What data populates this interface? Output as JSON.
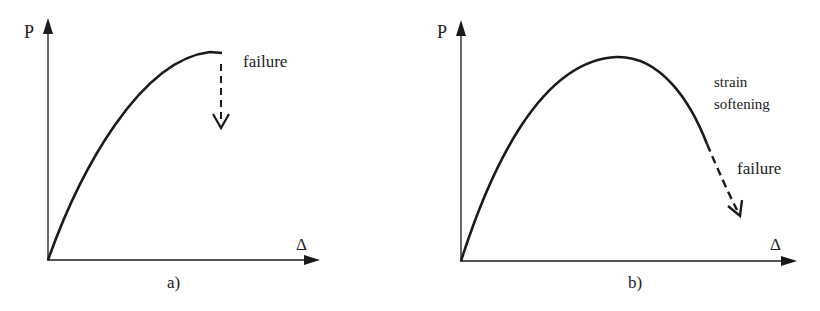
{
  "panels": [
    {
      "id": "a",
      "caption": "a)",
      "y_axis_label": "P",
      "x_axis_label": "Δ",
      "annotations": [
        "failure"
      ],
      "description": "Load rises with decreasing slope to a peak, then sudden (brittle) failure shown by a dashed downward arrow"
    },
    {
      "id": "b",
      "caption": "b)",
      "y_axis_label": "P",
      "x_axis_label": "Δ",
      "annotations": [
        "strain",
        "softening",
        "failure"
      ],
      "description": "Load rises to a peak, then decreases (strain softening) before failure shown by a dashed arrow continuing the descending curve"
    }
  ],
  "colors": {
    "line": "#1a1a1a",
    "text": "#222222",
    "background": "#ffffff"
  }
}
